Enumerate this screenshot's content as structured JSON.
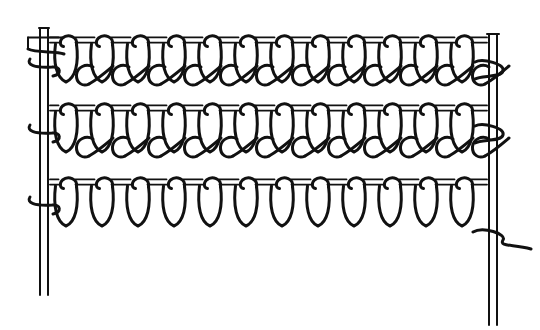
{
  "figure": {
    "title": "Knitted loop structure diagram",
    "kind": "line-art-technical-illustration",
    "background_color": "#ffffff",
    "ink_color": "#111111",
    "canvas": {
      "width": 540,
      "height": 330
    }
  },
  "selvedges": {
    "left": {
      "name": "left-selvedge-rail",
      "x_outer": 40,
      "x_inner": 48,
      "y_top": 28,
      "y_bottom": 295,
      "stroke_width": 2
    },
    "right": {
      "name": "right-selvedge-rail",
      "x_outer": 489,
      "x_inner": 497,
      "y_top": 34,
      "y_bottom": 325,
      "stroke_width": 2
    }
  },
  "rows": [
    {
      "id": "row-1",
      "label": "Top course",
      "baseline_y": 40,
      "loop_count": 12,
      "first_x": 66,
      "spacing": 36,
      "loop_width": 21,
      "loop_height": 42,
      "has_horizontal_bars": true,
      "stroke_width": 3
    },
    {
      "id": "row-2",
      "label": "Middle course",
      "baseline_y": 108,
      "loop_count": 12,
      "first_x": 66,
      "spacing": 36,
      "loop_width": 21,
      "loop_height": 44,
      "has_horizontal_bars": true,
      "stroke_width": 3
    },
    {
      "id": "row-3",
      "label": "Bottom course",
      "baseline_y": 182,
      "loop_count": 12,
      "first_x": 66,
      "spacing": 36,
      "loop_width": 21,
      "loop_height": 44,
      "has_horizontal_bars": true,
      "stroke_width": 3
    }
  ],
  "connector_rows": [
    {
      "id": "connector-1",
      "label": "Upper interlacing arcs",
      "baseline_y": 78,
      "count": 12,
      "first_x": 84,
      "spacing": 36
    },
    {
      "id": "connector-2",
      "label": "Lower interlacing arcs",
      "baseline_y": 150,
      "count": 12,
      "first_x": 84,
      "spacing": 36
    }
  ],
  "yarn_tails": {
    "left_tail": {
      "name": "left-yarn-tail",
      "x": 44,
      "y": 52
    },
    "right_tail": {
      "name": "right-yarn-tail",
      "x": 493,
      "y": 240
    }
  }
}
